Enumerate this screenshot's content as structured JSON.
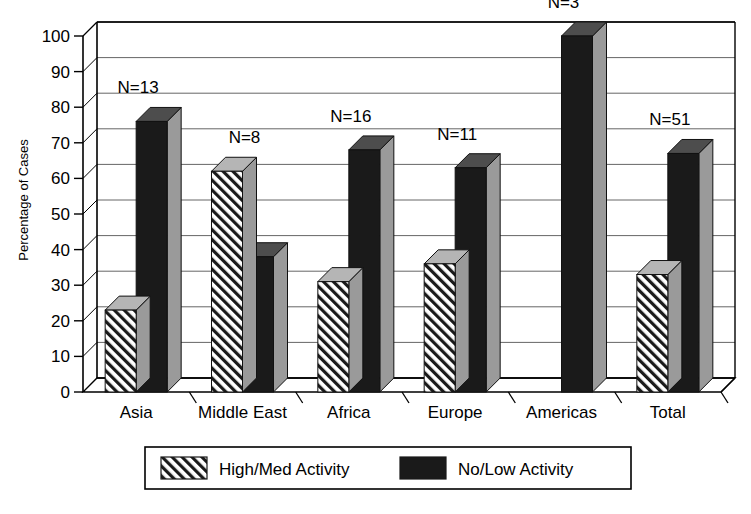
{
  "chart_data": {
    "type": "bar",
    "title": "",
    "subtitle": "",
    "xlabel": "",
    "ylabel": "Percentage of Cases",
    "ylim": [
      0,
      100
    ],
    "ytick_step": 10,
    "yticks": [
      "0",
      "10",
      "20",
      "30",
      "40",
      "50",
      "60",
      "70",
      "80",
      "90",
      "100"
    ],
    "grid": true,
    "grid_axis": "y",
    "legend_position": "bottom",
    "style": "3d-grouped-bars",
    "categories": [
      "Asia",
      "Middle East",
      "Africa",
      "Europe",
      "Americas",
      "Total"
    ],
    "annotations": [
      "N=13",
      "N=8",
      "N=16",
      "N=11",
      "N=3",
      "N=51"
    ],
    "series": [
      {
        "name": "High/Med Activity",
        "fill": "hatched",
        "color": "#1a1a1a",
        "values": [
          23,
          62,
          31,
          36,
          0,
          33
        ]
      },
      {
        "name": "No/Low Activity",
        "fill": "solid",
        "color": "#1a1a1a",
        "values": [
          76,
          38,
          68,
          63,
          100,
          67
        ]
      }
    ]
  },
  "legend": {
    "entries": [
      {
        "label": "High/Med Activity",
        "swatch": "hatched-swatch"
      },
      {
        "label": "No/Low Activity",
        "swatch": "solid-swatch"
      }
    ]
  },
  "colors": {
    "bar_front": "#1a1a1a",
    "bar_side": "#9a9a9a",
    "bar_top": "#4d4d4d",
    "hatch_bg": "#ffffff",
    "hatch_line": "#1a1a1a",
    "axis": "#000000",
    "grid": "#555555",
    "background": "#ffffff"
  }
}
